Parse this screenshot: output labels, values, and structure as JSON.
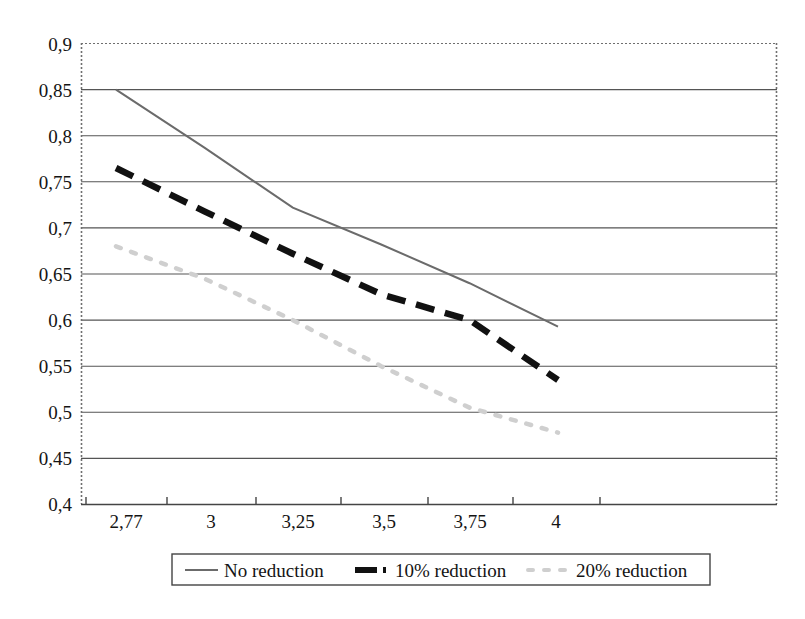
{
  "chart_data": {
    "type": "line",
    "title": "",
    "xlabel": "",
    "ylabel": "",
    "categories": [
      "2,77",
      "3",
      "3,25",
      "3,5",
      "3,75",
      "4"
    ],
    "x": [
      2.77,
      3,
      3.25,
      3.5,
      3.75,
      4
    ],
    "ylim": [
      0.4,
      0.9
    ],
    "yticks": [
      0.9,
      0.85,
      0.8,
      0.75,
      0.7,
      0.65,
      0.6,
      0.55,
      0.5,
      0.45,
      0.4
    ],
    "ytick_labels": [
      "0,9",
      "0,85",
      "0,8",
      "0,75",
      "0,7",
      "0,65",
      "0,6",
      "0,55",
      "0,5",
      "0,45",
      "0,4"
    ],
    "grid": "horizontal",
    "legend_position": "bottom",
    "series": [
      {
        "name": "No reduction",
        "style": "solid",
        "color": "#6b6b6b",
        "width": 2,
        "values": [
          0.85,
          0.787,
          0.722,
          0.682,
          0.64,
          0.593
        ]
      },
      {
        "name": "10% reduction",
        "style": "dashed",
        "color": "#111111",
        "width": 6,
        "values": [
          0.765,
          0.718,
          0.672,
          0.628,
          0.6,
          0.535
        ]
      },
      {
        "name": "20% reduction",
        "style": "dotted",
        "color": "#cfcfcf",
        "width": 4,
        "values": [
          0.68,
          0.645,
          0.6,
          0.55,
          0.505,
          0.478
        ]
      }
    ]
  },
  "axes": {
    "y_labels": [
      "0,9",
      "0,85",
      "0,8",
      "0,75",
      "0,7",
      "0,65",
      "0,6",
      "0,55",
      "0,5",
      "0,45",
      "0,4"
    ],
    "x_labels": [
      "2,77",
      "3",
      "3,25",
      "3,5",
      "3,75",
      "4"
    ]
  },
  "legend": {
    "items": [
      {
        "label": "No reduction",
        "marker": "solid-line-marker"
      },
      {
        "label": "10% reduction",
        "marker": "dashed-line-marker"
      },
      {
        "label": "20% reduction",
        "marker": "dotted-line-marker"
      }
    ]
  },
  "colors": {
    "series_no_reduction": "#6b6b6b",
    "series_10_reduction": "#111111",
    "series_20_reduction": "#cfcfcf",
    "gridline": "#555555",
    "border": "#7a7a7a",
    "text": "#141414"
  }
}
